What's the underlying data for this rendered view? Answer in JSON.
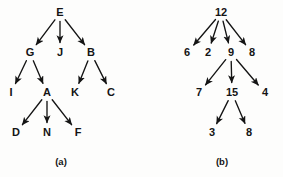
{
  "figure": {
    "background_color": "#fdfdfc",
    "ink_color": "#141414",
    "diagrams": [
      {
        "id": "diagram-a",
        "caption": "(a)",
        "caption_pos": {
          "x": 61,
          "y": 162
        },
        "nodes": [
          {
            "id": "E",
            "label": "E",
            "x": 60,
            "y": 13
          },
          {
            "id": "G",
            "label": "G",
            "x": 30,
            "y": 53
          },
          {
            "id": "J",
            "label": "J",
            "x": 60,
            "y": 53
          },
          {
            "id": "B",
            "label": "B",
            "x": 91,
            "y": 53
          },
          {
            "id": "I",
            "label": "I",
            "x": 11,
            "y": 93
          },
          {
            "id": "A",
            "label": "A",
            "x": 47,
            "y": 93
          },
          {
            "id": "K",
            "label": "K",
            "x": 75,
            "y": 93
          },
          {
            "id": "C",
            "label": "C",
            "x": 111,
            "y": 93
          },
          {
            "id": "D",
            "label": "D",
            "x": 16,
            "y": 133
          },
          {
            "id": "N",
            "label": "N",
            "x": 47,
            "y": 133
          },
          {
            "id": "F",
            "label": "F",
            "x": 78,
            "y": 133
          }
        ],
        "edges": [
          {
            "from": "E",
            "to": "G"
          },
          {
            "from": "E",
            "to": "J"
          },
          {
            "from": "E",
            "to": "B"
          },
          {
            "from": "G",
            "to": "I"
          },
          {
            "from": "G",
            "to": "A"
          },
          {
            "from": "B",
            "to": "K"
          },
          {
            "from": "B",
            "to": "C"
          },
          {
            "from": "A",
            "to": "D"
          },
          {
            "from": "A",
            "to": "N"
          },
          {
            "from": "A",
            "to": "F"
          }
        ]
      },
      {
        "id": "diagram-b",
        "caption": "(b)",
        "caption_pos": {
          "x": 222,
          "y": 162
        },
        "nodes": [
          {
            "id": "n12",
            "label": "12",
            "x": 221,
            "y": 13
          },
          {
            "id": "n6",
            "label": "6",
            "x": 187,
            "y": 53
          },
          {
            "id": "n2",
            "label": "2",
            "x": 208,
            "y": 53
          },
          {
            "id": "n9",
            "label": "9",
            "x": 231,
            "y": 53
          },
          {
            "id": "n8a",
            "label": "8",
            "x": 252,
            "y": 53
          },
          {
            "id": "n7",
            "label": "7",
            "x": 199,
            "y": 93
          },
          {
            "id": "n15",
            "label": "15",
            "x": 232,
            "y": 93
          },
          {
            "id": "n4",
            "label": "4",
            "x": 265,
            "y": 93
          },
          {
            "id": "n3",
            "label": "3",
            "x": 212,
            "y": 133
          },
          {
            "id": "n8b",
            "label": "8",
            "x": 249,
            "y": 133
          }
        ],
        "edges": [
          {
            "from": "n12",
            "to": "n6"
          },
          {
            "from": "n12",
            "to": "n2"
          },
          {
            "from": "n12",
            "to": "n9"
          },
          {
            "from": "n12",
            "to": "n8a"
          },
          {
            "from": "n9",
            "to": "n7"
          },
          {
            "from": "n9",
            "to": "n15"
          },
          {
            "from": "n9",
            "to": "n4"
          },
          {
            "from": "n15",
            "to": "n3"
          },
          {
            "from": "n15",
            "to": "n8b"
          }
        ]
      }
    ]
  }
}
